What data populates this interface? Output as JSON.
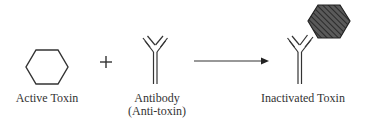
{
  "diagram": {
    "type": "reaction",
    "elements": [
      {
        "id": "active-toxin",
        "shape": "hexagon",
        "fill": "none",
        "label": "Active Toxin"
      },
      {
        "id": "plus",
        "symbol": "+"
      },
      {
        "id": "antibody",
        "shape": "Y-shaped antibody",
        "label_line1": "Antibody",
        "label_line2": "(Anti-toxin)"
      },
      {
        "id": "arrow",
        "symbol": "→"
      },
      {
        "id": "inactivated-toxin",
        "shape": "antibody bound to hatched hexagon",
        "label": "Inactivated Toxin"
      }
    ],
    "colors": {
      "stroke": "#333333",
      "hatched_fill": "#555555",
      "background": "#ffffff"
    }
  },
  "labels": {
    "active_toxin": "Active Toxin",
    "antibody_line1": "Antibody",
    "antibody_line2": "(Anti-toxin)",
    "inactivated_toxin": "Inactivated Toxin",
    "plus": "+"
  }
}
